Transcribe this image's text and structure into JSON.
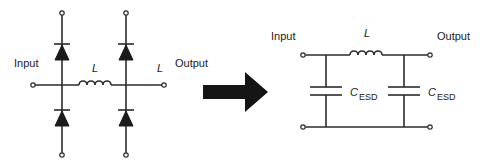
{
  "diagram": {
    "type": "circuit-equivalence",
    "left_circuit": {
      "title": "ESD diode protection with series inductor",
      "labels": {
        "input": "Input",
        "output": "Output",
        "inductor": "L",
        "inductor_right": "L"
      },
      "components": [
        {
          "id": "D1",
          "type": "diode",
          "position": "input-branch-top"
        },
        {
          "id": "D2",
          "type": "diode",
          "position": "input-branch-bottom"
        },
        {
          "id": "D3",
          "type": "diode",
          "position": "output-branch-top"
        },
        {
          "id": "D4",
          "type": "diode",
          "position": "output-branch-bottom"
        },
        {
          "id": "L1",
          "type": "inductor",
          "label": "L"
        }
      ]
    },
    "arrow": {
      "meaning": "equivalent-to",
      "color": "#151515"
    },
    "right_circuit": {
      "title": "Equivalent LC pi-filter",
      "labels": {
        "input": "Input",
        "output": "Output",
        "inductor": "L",
        "cap_left_main": "C",
        "cap_left_sub": "ESD",
        "cap_right_main": "C",
        "cap_right_sub": "ESD"
      },
      "components": [
        {
          "id": "C1",
          "type": "capacitor",
          "label": "C_ESD"
        },
        {
          "id": "L1",
          "type": "inductor",
          "label": "L"
        },
        {
          "id": "C2",
          "type": "capacitor",
          "label": "C_ESD"
        }
      ]
    },
    "colors": {
      "line": "#2b2b2b",
      "fill": "#1a1a1a",
      "background": "#ffffff"
    }
  }
}
